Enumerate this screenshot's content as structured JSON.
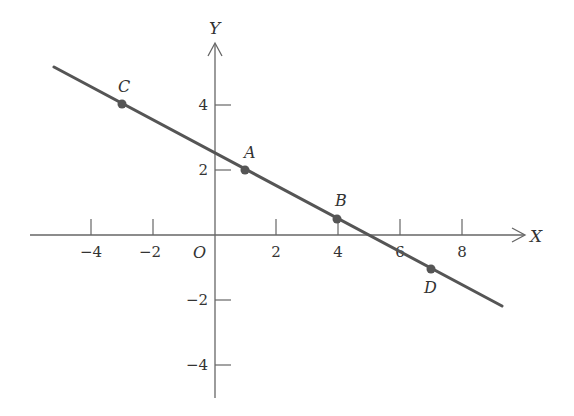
{
  "diagram": {
    "type": "coordinate-plane-line",
    "axes": {
      "x_label": "X",
      "y_label": "Y",
      "origin_label": "O",
      "x_ticks": [
        {
          "value": -4,
          "label": "−4"
        },
        {
          "value": -2,
          "label": "−2"
        },
        {
          "value": 2,
          "label": "2"
        },
        {
          "value": 4,
          "label": "4"
        },
        {
          "value": 6,
          "label": "6"
        },
        {
          "value": 8,
          "label": "8"
        }
      ],
      "y_ticks": [
        {
          "value": 4,
          "label": "4"
        },
        {
          "value": 2,
          "label": "2"
        },
        {
          "value": -2,
          "label": "−2"
        },
        {
          "value": -4,
          "label": "−4"
        }
      ]
    },
    "line": {
      "equation": "y = 2.5 - 0.5x",
      "slope": -0.5,
      "y_intercept": 2.5,
      "x_start": -5.2,
      "x_end": 9.2
    },
    "points": [
      {
        "label": "C",
        "x": -3,
        "y": 4
      },
      {
        "label": "A",
        "x": 1,
        "y": 2
      },
      {
        "label": "B",
        "x": 4,
        "y": 0.5
      },
      {
        "label": "D",
        "x": 7,
        "y": -1
      }
    ],
    "colors": {
      "line": "#555555",
      "axis": "#666666",
      "point": "#555555",
      "text": "#333333"
    }
  }
}
